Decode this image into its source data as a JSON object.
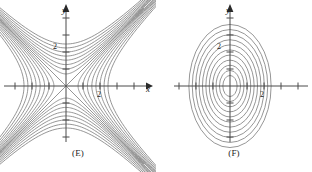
{
  "figure": {
    "width": 312,
    "height": 172,
    "background": "#ffffff",
    "curve_color": "#8a8a8a",
    "axis_color": "#4a4a4a",
    "text_color": "#1a1a1a"
  },
  "panels": [
    {
      "id": "E",
      "caption": "(E)",
      "x_axis_label": "x",
      "y_axis_label": "y",
      "x_tick_label": "2",
      "y_tick_label": "2",
      "has_x_arrow": true,
      "has_y_arrow": true
    },
    {
      "id": "F",
      "caption": "(F)",
      "x_axis_label": "",
      "y_axis_label": "y",
      "x_tick_label": "2",
      "y_tick_label": "2",
      "has_x_arrow": false,
      "has_y_arrow": true
    }
  ],
  "chart_data": [
    {
      "type": "line",
      "id": "E",
      "title": "(E)",
      "xlabel": "x",
      "ylabel": "y",
      "grid": false,
      "legend": null,
      "description": "Contour map of a saddle function: family of hyperbolas with diagonal asymptotes y = x and y = -x, opening left/right and up/down.",
      "contour_family": "hyperbolas",
      "asymptotes": [
        "y = x",
        "y = -x"
      ],
      "xlim": [
        -5,
        5
      ],
      "ylim": [
        -5,
        5
      ],
      "x_ticks": [
        -4,
        -3,
        -2,
        -1,
        1,
        2,
        3,
        4
      ],
      "y_ticks": [
        -4,
        -3,
        -2,
        -1,
        1,
        2,
        3,
        4
      ],
      "labeled_x_ticks": [
        2
      ],
      "labeled_y_ticks": [
        2
      ],
      "levels": [
        0.5,
        1.0,
        1.6,
        2.3,
        3.1,
        4.0,
        5.0,
        6.1
      ],
      "series": [
        {
          "name": "k = 0.5",
          "branch": "horizontal",
          "vertex_x": 0.71
        },
        {
          "name": "k = 1.0",
          "branch": "horizontal",
          "vertex_x": 1.0
        },
        {
          "name": "k = 1.6",
          "branch": "horizontal",
          "vertex_x": 1.26
        },
        {
          "name": "k = 2.3",
          "branch": "horizontal",
          "vertex_x": 1.52
        },
        {
          "name": "k = 3.1",
          "branch": "horizontal",
          "vertex_x": 1.76
        },
        {
          "name": "k = 4.0",
          "branch": "horizontal",
          "vertex_x": 2.0
        },
        {
          "name": "k = 5.0",
          "branch": "horizontal",
          "vertex_x": 2.24
        },
        {
          "name": "k = 6.1",
          "branch": "horizontal",
          "vertex_x": 2.47
        },
        {
          "name": "k = -0.5",
          "branch": "vertical",
          "vertex_y": 0.71
        },
        {
          "name": "k = -1.0",
          "branch": "vertical",
          "vertex_y": 1.0
        },
        {
          "name": "k = -1.6",
          "branch": "vertical",
          "vertex_y": 1.26
        },
        {
          "name": "k = -2.3",
          "branch": "vertical",
          "vertex_y": 1.52
        },
        {
          "name": "k = -3.1",
          "branch": "vertical",
          "vertex_y": 1.76
        },
        {
          "name": "k = -4.0",
          "branch": "vertical",
          "vertex_y": 2.0
        },
        {
          "name": "k = -5.0",
          "branch": "vertical",
          "vertex_y": 2.24
        },
        {
          "name": "k = -6.1",
          "branch": "vertical",
          "vertex_y": 2.47
        }
      ]
    },
    {
      "type": "line",
      "id": "F",
      "title": "(F)",
      "xlabel": "",
      "ylabel": "y",
      "grid": false,
      "legend": null,
      "description": "Contour map of an elliptic paraboloid: nested concentric ellipses centered at the origin, taller than wide (major axis vertical).",
      "contour_family": "ellipses",
      "center": [
        0,
        0
      ],
      "xlim": [
        -5,
        5
      ],
      "ylim": [
        -5,
        5
      ],
      "x_ticks": [
        -4,
        -3,
        -2,
        -1,
        1,
        2,
        3,
        4
      ],
      "y_ticks": [
        -4,
        -3,
        -2,
        -1,
        1,
        2,
        3,
        4
      ],
      "labeled_x_ticks": [
        2
      ],
      "labeled_y_ticks": [
        2
      ],
      "levels": [
        1,
        2,
        3,
        4,
        5,
        6,
        7,
        8,
        9,
        10,
        11
      ],
      "series": [
        {
          "name": "level 1",
          "semi_x": 0.42,
          "semi_y": 0.62
        },
        {
          "name": "level 2",
          "semi_x": 0.62,
          "semi_y": 0.92
        },
        {
          "name": "level 3",
          "semi_x": 0.82,
          "semi_y": 1.22
        },
        {
          "name": "level 4",
          "semi_x": 1.02,
          "semi_y": 1.52
        },
        {
          "name": "level 5",
          "semi_x": 1.22,
          "semi_y": 1.82
        },
        {
          "name": "level 6",
          "semi_x": 1.42,
          "semi_y": 2.12
        },
        {
          "name": "level 7",
          "semi_x": 1.62,
          "semi_y": 2.42
        },
        {
          "name": "level 8",
          "semi_x": 1.82,
          "semi_y": 2.72
        },
        {
          "name": "level 9",
          "semi_x": 2.02,
          "semi_y": 3.02
        },
        {
          "name": "level 10",
          "semi_x": 2.22,
          "semi_y": 3.32
        },
        {
          "name": "level 11",
          "semi_x": 2.42,
          "semi_y": 3.62
        }
      ]
    }
  ]
}
